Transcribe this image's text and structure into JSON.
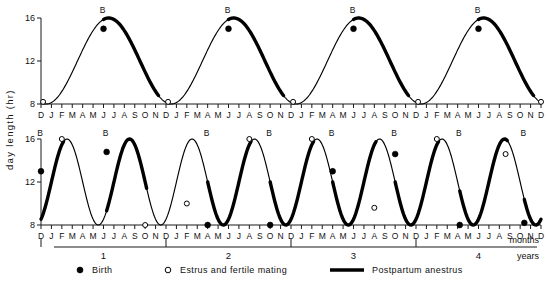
{
  "figure": {
    "y_axis_title": "day length (hr)",
    "x_unit_months": "months",
    "x_unit_years": "years"
  },
  "axes": {
    "y_ticks": [
      "16",
      "12",
      "8"
    ],
    "y_values": [
      16,
      12,
      8
    ],
    "month_labels": [
      "D",
      "J",
      "F",
      "M",
      "A",
      "M",
      "J",
      "J",
      "A",
      "S",
      "O",
      "N",
      "D",
      "J",
      "F",
      "M",
      "A",
      "M",
      "J",
      "J",
      "A",
      "S",
      "O",
      "N",
      "D",
      "J",
      "F",
      "M",
      "A",
      "M",
      "J",
      "J",
      "A",
      "S",
      "O",
      "N",
      "D",
      "J",
      "F",
      "M",
      "A",
      "M",
      "J",
      "J",
      "A",
      "S",
      "O",
      "N",
      "D"
    ],
    "year_labels": [
      "1",
      "2",
      "3",
      "4"
    ]
  },
  "legend": {
    "items": [
      {
        "key": "birth",
        "symbol": "filled-circle",
        "label": "Birth"
      },
      {
        "key": "estrus",
        "symbol": "open-circle",
        "label": "Estrus  and  fertile  mating"
      },
      {
        "key": "anestrus",
        "symbol": "thick-line",
        "label": "Postpartum  anestrus"
      }
    ]
  },
  "chart_data": {
    "type": "line",
    "title": "",
    "xlabel": "months / years",
    "ylabel": "day length (hr)",
    "ylim": [
      7.2,
      16.6
    ],
    "xlim": [
      0,
      48
    ],
    "grid": false,
    "legend_position": "bottom",
    "x_tick_interval_months": 1,
    "panels": [
      {
        "name": "annual-breeder",
        "period_months": 12,
        "amplitude_hr": 4.0,
        "mean_hr": 12.0,
        "peak_month_index": 6.5,
        "description": "Day length sinusoid with one 12-month cycle per year; one birth per year near the rising phase, estrus at each winter trough.",
        "curve_note": "y = 12 + 4*sin(2*pi*(x-3.5)/12)",
        "birth_markers": [
          {
            "x_month": 6.0,
            "y_hr": 15.0,
            "label": "B"
          },
          {
            "x_month": 18.0,
            "y_hr": 15.0,
            "label": "B"
          },
          {
            "x_month": 30.0,
            "y_hr": 15.0,
            "label": "B"
          },
          {
            "x_month": 42.0,
            "y_hr": 15.0,
            "label": "B"
          }
        ],
        "estrus_markers": [
          {
            "x_month": 0.2,
            "y_hr": 8.2
          },
          {
            "x_month": 12.2,
            "y_hr": 8.2
          },
          {
            "x_month": 24.2,
            "y_hr": 8.2
          },
          {
            "x_month": 36.2,
            "y_hr": 8.2
          },
          {
            "x_month": 48.0,
            "y_hr": 8.2
          }
        ],
        "anestrus_segments": [
          {
            "start_month": 6.0,
            "end_month": 11.3
          },
          {
            "start_month": 18.0,
            "end_month": 23.3
          },
          {
            "start_month": 30.0,
            "end_month": 35.3
          },
          {
            "start_month": 42.0,
            "end_month": 47.3
          }
        ]
      },
      {
        "name": "short-cycle-breeder",
        "period_months": 12,
        "amplitude_hr": 4.0,
        "mean_hr": 12.0,
        "description": "Same annual day-length curve compressed to two cycles per year in this animal; births alternate between peaks and troughs, estrus follows each postpartum anestrus.",
        "curve_note": "y = 12 + 4*sin(2*pi*(x-1.0)/6)",
        "birth_markers": [
          {
            "x_month": 0.0,
            "y_hr": 13.0,
            "label": "B"
          },
          {
            "x_month": 6.3,
            "y_hr": 14.8,
            "label": "B"
          },
          {
            "x_month": 16.0,
            "y_hr": 8.0,
            "label": "B"
          },
          {
            "x_month": 22.0,
            "y_hr": 8.0,
            "label": "B"
          },
          {
            "x_month": 28.0,
            "y_hr": 13.0,
            "label": "B"
          },
          {
            "x_month": 34.0,
            "y_hr": 14.6,
            "label": "B"
          },
          {
            "x_month": 40.2,
            "y_hr": 8.0,
            "label": "B"
          },
          {
            "x_month": 46.4,
            "y_hr": 8.2,
            "label": "B"
          }
        ],
        "estrus_markers": [
          {
            "x_month": 2.0,
            "y_hr": 16.0
          },
          {
            "x_month": 10.0,
            "y_hr": 8.0
          },
          {
            "x_month": 14.0,
            "y_hr": 10.0
          },
          {
            "x_month": 20.0,
            "y_hr": 16.0
          },
          {
            "x_month": 26.0,
            "y_hr": 16.0
          },
          {
            "x_month": 32.0,
            "y_hr": 9.6
          },
          {
            "x_month": 38.0,
            "y_hr": 16.0
          },
          {
            "x_month": 44.6,
            "y_hr": 14.6
          }
        ],
        "anestrus_segments": [
          {
            "start_month": 0.0,
            "end_month": 2.2
          },
          {
            "start_month": 6.3,
            "end_month": 10.2
          },
          {
            "start_month": 16.0,
            "end_month": 20.2
          },
          {
            "start_month": 22.0,
            "end_month": 26.2
          },
          {
            "start_month": 28.0,
            "end_month": 32.2
          },
          {
            "start_month": 34.0,
            "end_month": 38.2
          },
          {
            "start_month": 40.2,
            "end_month": 44.8
          },
          {
            "start_month": 46.4,
            "end_month": 48.0
          }
        ]
      }
    ]
  }
}
